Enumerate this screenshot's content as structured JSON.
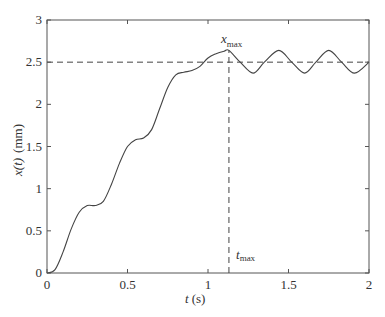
{
  "chart_data": {
    "type": "line",
    "title": "",
    "xlabel": "t (s)",
    "ylabel": "x(t)  (mm)",
    "xlim": [
      0,
      2
    ],
    "ylim": [
      0,
      3
    ],
    "grid": false,
    "legend": null,
    "xticks": [
      0,
      0.5,
      1,
      1.5,
      2
    ],
    "xtick_labels": [
      "0",
      "0.5",
      "1",
      "1.5",
      "2"
    ],
    "yticks": [
      0,
      0.5,
      1,
      1.5,
      2,
      2.5,
      3
    ],
    "ytick_labels": [
      "0",
      "0.5",
      "1",
      "1.5",
      "2",
      "2.5",
      "3"
    ],
    "series": [
      {
        "name": "x(t)",
        "style": "solid",
        "x": [
          0,
          0.05,
          0.1,
          0.15,
          0.2,
          0.25,
          0.3,
          0.35,
          0.4,
          0.45,
          0.5,
          0.55,
          0.6,
          0.65,
          0.7,
          0.75,
          0.8,
          0.85,
          0.9,
          0.95,
          1.0,
          1.05,
          1.1,
          1.13,
          1.2,
          1.28,
          1.35,
          1.44,
          1.52,
          1.6,
          1.67,
          1.75,
          1.83,
          1.91,
          2.0
        ],
        "y": [
          0,
          0.04,
          0.25,
          0.52,
          0.72,
          0.8,
          0.8,
          0.85,
          1.05,
          1.3,
          1.5,
          1.58,
          1.6,
          1.7,
          1.95,
          2.2,
          2.35,
          2.38,
          2.4,
          2.45,
          2.55,
          2.6,
          2.63,
          2.64,
          2.5,
          2.37,
          2.5,
          2.64,
          2.5,
          2.37,
          2.5,
          2.64,
          2.5,
          2.37,
          2.5
        ]
      },
      {
        "name": "steady-state reference",
        "style": "dashed",
        "x": [
          0,
          2
        ],
        "y": [
          2.5,
          2.5
        ]
      },
      {
        "name": "t_max marker",
        "style": "dashed",
        "x": [
          1.13,
          1.13
        ],
        "y": [
          0,
          2.64
        ]
      }
    ],
    "annotations": [
      {
        "text": "x",
        "subscript": "max",
        "x": 1.13,
        "y": 2.72
      },
      {
        "text": "t",
        "subscript": "max",
        "x": 1.2,
        "y": 0.2
      }
    ]
  },
  "labels": {
    "xlabel_main": "t",
    "xlabel_unit": "(s)",
    "ylabel_main": "x(t)",
    "ylabel_unit": "(mm)",
    "xmax_main": "x",
    "xmax_sub": "max",
    "tmax_main": "t",
    "tmax_sub": "max"
  }
}
